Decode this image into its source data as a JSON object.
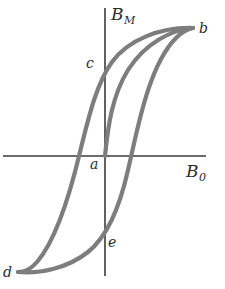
{
  "figure": {
    "background_color": "#ffffff",
    "axis_color": "#3a3a3a",
    "curve_color": "#7d7d7d",
    "label_color": "#2b2b2b",
    "curve_stroke_width": 4.2,
    "axis_stroke_width": 1.6
  },
  "axes": {
    "y_axis": {
      "name": "vertical-axis",
      "label_symbol": "B",
      "label_subscript": "M",
      "x": 105,
      "y_top": 8,
      "y_bottom": 276
    },
    "x_axis": {
      "name": "horizontal-axis",
      "label_symbol": "B",
      "label_subscript": "0",
      "y": 156,
      "x_left": 3,
      "x_right": 206
    },
    "origin": {
      "x": 105,
      "y": 156
    }
  },
  "points": [
    {
      "id": "a",
      "label": "a",
      "x": 105,
      "y": 156,
      "meaning": "origin-unmagnetized-state"
    },
    {
      "id": "b",
      "label": "b",
      "x": 193,
      "y": 28,
      "meaning": "positive-saturation"
    },
    {
      "id": "c",
      "label": "c",
      "x": 105,
      "y": 68,
      "meaning": "positive-remanence"
    },
    {
      "id": "d",
      "label": "d",
      "x": 18,
      "y": 272,
      "meaning": "negative-saturation"
    },
    {
      "id": "e",
      "label": "e",
      "x": 105,
      "y": 243,
      "meaning": "negative-remanence"
    }
  ],
  "chart_data": {
    "type": "line",
    "xlabel": "B_0",
    "ylabel": "B_M",
    "grid": false,
    "legend": null,
    "xlim": [
      -105,
      101
    ],
    "ylim": [
      -120,
      148
    ],
    "series": [
      {
        "name": "initial-magnetization-curve",
        "description": "virgin curve from origin a rising to saturation b",
        "path": "M 105 156 C 108 126 112 96 128 70 C 146 42 172 30 193 28"
      },
      {
        "name": "descending-branch",
        "description": "from saturation b through remanence c, across axis, down to negative saturation d",
        "path": "M 193 28 C 160 27 128 40 112 62 C 96 84 88 120 80 152 C 71 190 56 240 37 262 C 31 269 24 272 18 272"
      },
      {
        "name": "ascending-branch",
        "description": "from negative saturation d through e, across axis, up to saturation b",
        "path": "M 18 272 C 40 274 68 268 88 252 C 108 236 120 206 128 170 C 137 132 148 66 176 38 C 182 32 188 29 193 28"
      }
    ],
    "axis_crossings": {
      "descending_branch_x_axis": {
        "x": 72,
        "y": 156
      },
      "ascending_branch_x_axis": {
        "x": 137,
        "y": 156
      },
      "descending_branch_y_axis": {
        "x": 105,
        "y": 68
      },
      "ascending_branch_y_axis": {
        "x": 105,
        "y": 243
      }
    }
  }
}
